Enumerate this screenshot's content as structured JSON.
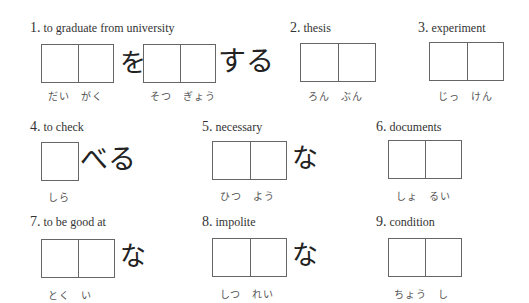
{
  "items": [
    {
      "number": "1.",
      "prompt": "to graduate from university",
      "readings": [
        "だい　がく",
        "そつ　ぎょう"
      ],
      "particle": "を",
      "suffix": "する"
    },
    {
      "number": "2.",
      "prompt": "thesis",
      "readings": [
        "ろん　ぶん"
      ]
    },
    {
      "number": "3.",
      "prompt": "experiment",
      "readings": [
        "じっ　けん"
      ]
    },
    {
      "number": "4.",
      "prompt": "to check",
      "readings": [
        "しら"
      ],
      "suffix": "べる"
    },
    {
      "number": "5.",
      "prompt": "necessary",
      "readings": [
        "ひつ　よう"
      ],
      "suffix": "な"
    },
    {
      "number": "6.",
      "prompt": "documents",
      "readings": [
        "しょ　るい"
      ]
    },
    {
      "number": "7.",
      "prompt": "to be good at",
      "readings": [
        "とく　い"
      ],
      "suffix": "な"
    },
    {
      "number": "8.",
      "prompt": "impolite",
      "readings": [
        "しつ　れい"
      ],
      "suffix": "な"
    },
    {
      "number": "9.",
      "prompt": "condition",
      "readings": [
        "ちょう　し"
      ]
    }
  ]
}
